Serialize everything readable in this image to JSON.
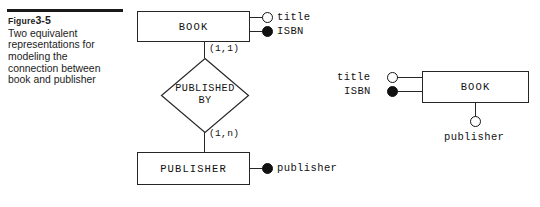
{
  "figure": {
    "label_word": "Figure",
    "number": "3-5",
    "caption": "Two equivalent representations for modeling the connection between book and publisher"
  },
  "diagram_left": {
    "entity_book": "BOOK",
    "entity_publisher": "PUBLISHER",
    "relationship_line1": "PUBLISHED",
    "relationship_line2": "BY",
    "attr_title": "title",
    "attr_isbn": "ISBN",
    "attr_publisher": "publisher",
    "cardinality_top": "(1,1)",
    "cardinality_bottom": "(1,n)",
    "marker_title": "hollow-circle-icon",
    "marker_isbn": "filled-circle-icon",
    "marker_publisher": "filled-circle-icon"
  },
  "diagram_right": {
    "entity_book": "BOOK",
    "attr_title": "title",
    "attr_isbn": "ISBN",
    "attr_publisher": "publisher",
    "marker_title": "hollow-circle-icon",
    "marker_isbn": "filled-circle-icon",
    "marker_publisher": "hollow-circle-icon"
  },
  "colors": {
    "ink": "#1a1a1a",
    "line": "#262626",
    "background": "#ffffff"
  }
}
